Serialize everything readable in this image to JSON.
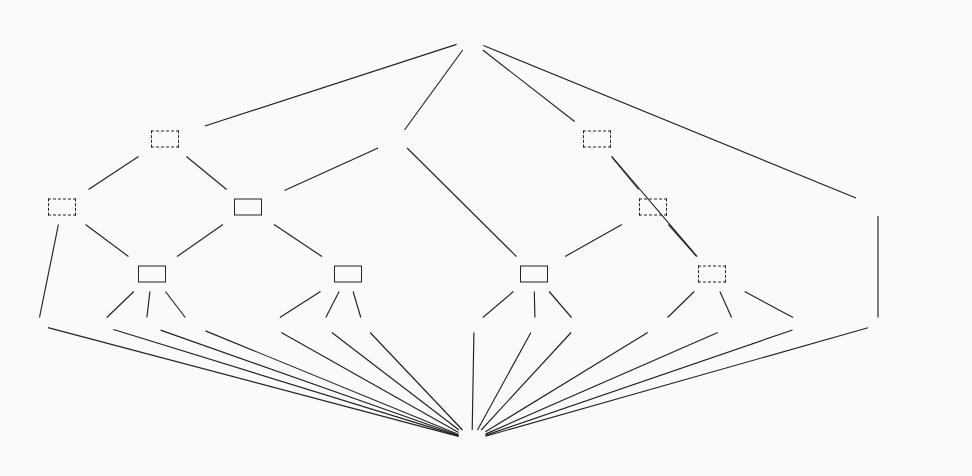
{
  "figure": {
    "kind": "lattice-diagram",
    "title": "",
    "top_element": {
      "symbol": "⊤",
      "subscript": "SF"
    },
    "bottom_element": {
      "symbol": "⊥",
      "subscript": "SF"
    },
    "ellipsis_glyph": "···"
  },
  "nodes": [
    {
      "id": "top",
      "label": "⊤",
      "sub": "SF",
      "box": "none",
      "x": 470,
      "y": 40,
      "kind": "extreme"
    },
    {
      "id": "unum_eps",
      "label": "UNum",
      "sup": "ϵ",
      "box": "dashed",
      "x": 165,
      "y": 139
    },
    {
      "id": "numeric",
      "label": "Numeric",
      "box": "none",
      "x": 398,
      "y": 139
    },
    {
      "id": "notuintne",
      "label": "NotUIntNotEmpty",
      "box": "dashed",
      "x": 597,
      "y": 139
    },
    {
      "id": "uint_eps",
      "label": "UInt",
      "sup": "ϵ",
      "box": "dashed",
      "x": 62,
      "y": 207
    },
    {
      "id": "unum",
      "label": "UNum",
      "box": "solid",
      "x": 248,
      "y": 207
    },
    {
      "id": "notunsne",
      "label": "NotUnsignedNotEmpty",
      "box": "dashed",
      "x": 653,
      "y": 207
    },
    {
      "id": "notnumeric",
      "label": "NotNumeric",
      "box": "none",
      "x": 878,
      "y": 207
    },
    {
      "id": "uint",
      "label": "UInt",
      "box": "solid",
      "x": 152,
      "y": 274
    },
    {
      "id": "ufloat",
      "label": "UFloat",
      "box": "solid",
      "x": 348,
      "y": 274
    },
    {
      "id": "signednum",
      "label": "SignedNum",
      "box": "solid",
      "x": 534,
      "y": 274
    },
    {
      "id": "notnumne",
      "label": "NotNumNotEmpty",
      "box": "dashed",
      "x": 712,
      "y": 274
    },
    {
      "id": "bottom",
      "label": "⊥",
      "sub": "SF",
      "box": "none",
      "x": 472,
      "y": 440,
      "kind": "extreme"
    }
  ],
  "leaves": [
    {
      "id": "empty_l",
      "label": "\"\"",
      "x": 38,
      "y": 325,
      "type": "string"
    },
    {
      "id": "s1",
      "label": "\"1\"",
      "x": 99,
      "y": 325,
      "type": "string"
    },
    {
      "id": "s2",
      "label": "\"2\"",
      "x": 146,
      "y": 325,
      "type": "string"
    },
    {
      "id": "e1",
      "label": "···",
      "x": 191,
      "y": 325,
      "type": "ellipsis"
    },
    {
      "id": "s13",
      "label": "\"1.3\"",
      "x": 268,
      "y": 325,
      "type": "string"
    },
    {
      "id": "s25",
      "label": "\"2.5\"",
      "x": 322,
      "y": 325,
      "type": "string"
    },
    {
      "id": "e2",
      "label": "···",
      "x": 363,
      "y": 325,
      "type": "ellipsis"
    },
    {
      "id": "sneg02",
      "label": "\"-0.2\"",
      "x": 474,
      "y": 325,
      "type": "string"
    },
    {
      "id": "splus2",
      "label": "\"+2\"",
      "x": 535,
      "y": 325,
      "type": "string"
    },
    {
      "id": "e3",
      "label": "···",
      "x": 578,
      "y": 325,
      "type": "ellipsis"
    },
    {
      "id": "sfoo",
      "label": "\"foo\"",
      "x": 660,
      "y": 325,
      "type": "string"
    },
    {
      "id": "sbar",
      "label": "\"bar\"",
      "x": 735,
      "y": 325,
      "type": "string"
    },
    {
      "id": "e4",
      "label": "···",
      "x": 807,
      "y": 325,
      "type": "ellipsis"
    },
    {
      "id": "empty_r",
      "label": "\"\"",
      "x": 878,
      "y": 325,
      "type": "string"
    }
  ],
  "edges": [
    {
      "from": "top",
      "to": "unum_eps"
    },
    {
      "from": "top",
      "to": "numeric"
    },
    {
      "from": "top",
      "to": "notuintne"
    },
    {
      "from": "top",
      "to": "notnumeric"
    },
    {
      "from": "unum_eps",
      "to": "uint_eps"
    },
    {
      "from": "unum_eps",
      "to": "unum"
    },
    {
      "from": "numeric",
      "to": "unum"
    },
    {
      "from": "numeric",
      "to": "signednum"
    },
    {
      "from": "notuintne",
      "to": "notunsne"
    },
    {
      "from": "notuintne",
      "to": "notnumne"
    },
    {
      "from": "notunsne",
      "to": "signednum"
    },
    {
      "from": "notunsne",
      "to": "notnumne"
    },
    {
      "from": "uint_eps",
      "to": "uint"
    },
    {
      "from": "uint_eps",
      "to": "empty_l"
    },
    {
      "from": "unum",
      "to": "uint"
    },
    {
      "from": "unum",
      "to": "ufloat"
    },
    {
      "from": "uint",
      "to": "s1"
    },
    {
      "from": "uint",
      "to": "s2"
    },
    {
      "from": "uint",
      "to": "e1"
    },
    {
      "from": "ufloat",
      "to": "s13"
    },
    {
      "from": "ufloat",
      "to": "s25"
    },
    {
      "from": "ufloat",
      "to": "e2"
    },
    {
      "from": "signednum",
      "to": "sneg02"
    },
    {
      "from": "signednum",
      "to": "splus2"
    },
    {
      "from": "signednum",
      "to": "e3"
    },
    {
      "from": "notnumne",
      "to": "sfoo"
    },
    {
      "from": "notnumne",
      "to": "sbar"
    },
    {
      "from": "notnumne",
      "to": "e4"
    },
    {
      "from": "notnumeric",
      "to": "empty_r"
    },
    {
      "from": "empty_l",
      "to": "bottom"
    },
    {
      "from": "s1",
      "to": "bottom"
    },
    {
      "from": "s2",
      "to": "bottom"
    },
    {
      "from": "e1",
      "to": "bottom"
    },
    {
      "from": "s13",
      "to": "bottom"
    },
    {
      "from": "s25",
      "to": "bottom"
    },
    {
      "from": "e2",
      "to": "bottom"
    },
    {
      "from": "sneg02",
      "to": "bottom"
    },
    {
      "from": "splus2",
      "to": "bottom"
    },
    {
      "from": "e3",
      "to": "bottom"
    },
    {
      "from": "sfoo",
      "to": "bottom"
    },
    {
      "from": "sbar",
      "to": "bottom"
    },
    {
      "from": "e4",
      "to": "bottom"
    },
    {
      "from": "empty_r",
      "to": "bottom"
    }
  ],
  "style": {
    "line_color": "#222222",
    "text_color": "#151515",
    "background": "#fbfaf8",
    "solid_border": "#222222",
    "dashed_border": "#222222"
  }
}
